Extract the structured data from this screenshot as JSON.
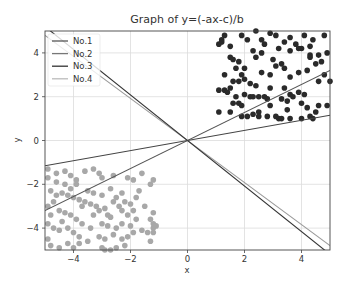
{
  "chart_data": {
    "type": "scatter",
    "title": "Graph of y=(-ax-c)/b",
    "xlabel": "x",
    "ylabel": "y",
    "xlim": [
      -5,
      5
    ],
    "ylim": [
      -5,
      5
    ],
    "xticks": [
      -4,
      -2,
      0,
      2,
      4
    ],
    "yticks": [
      -4,
      -2,
      0,
      2,
      4
    ],
    "grid": true,
    "legend_position": "upper left",
    "lines": [
      {
        "name": "No.1",
        "slope": 0.64,
        "intercept": 0,
        "color": "#555555"
      },
      {
        "name": "No.2",
        "slope": -0.96,
        "intercept": 0,
        "color": "#777777"
      },
      {
        "name": "No.3",
        "slope": -1.04,
        "intercept": 0,
        "color": "#333333"
      },
      {
        "name": "No.4",
        "slope": 0.23,
        "intercept": 0,
        "color": "#bbbbbb"
      }
    ],
    "lines_note": "No.4 drawn in legend as light gray; the shallow ascending line renders dark (#444). Colors kept per legend swatches.",
    "series": [
      {
        "name": "class-positive",
        "color": "#2a2a2a",
        "points": [
          [
            1.1,
            4.4
          ],
          [
            1.2,
            4.6
          ],
          [
            1.3,
            4.8
          ],
          [
            1.2,
            4.5
          ],
          [
            1.5,
            4.3
          ],
          [
            1.9,
            4.8
          ],
          [
            2.4,
            5.0
          ],
          [
            2.6,
            4.6
          ],
          [
            2.9,
            4.9
          ],
          [
            3.1,
            4.8
          ],
          [
            3.4,
            4.5
          ],
          [
            3.6,
            4.7
          ],
          [
            3.8,
            4.4
          ],
          [
            3.9,
            4.2
          ],
          [
            4.3,
            4.3
          ],
          [
            4.3,
            3.9
          ],
          [
            4.6,
            3.9
          ],
          [
            4.9,
            4.0
          ],
          [
            1.5,
            3.8
          ],
          [
            1.6,
            3.7
          ],
          [
            1.8,
            3.6
          ],
          [
            1.7,
            3.3
          ],
          [
            2.0,
            3.3
          ],
          [
            2.3,
            4.1
          ],
          [
            2.4,
            3.8
          ],
          [
            2.6,
            4.0
          ],
          [
            3.0,
            3.7
          ],
          [
            3.3,
            3.5
          ],
          [
            3.4,
            3.3
          ],
          [
            3.2,
            4.2
          ],
          [
            4.0,
            4.2
          ],
          [
            4.3,
            3.8
          ],
          [
            1.3,
            3.0
          ],
          [
            1.6,
            2.7
          ],
          [
            2.0,
            2.8
          ],
          [
            2.2,
            2.6
          ],
          [
            2.4,
            2.5
          ],
          [
            2.0,
            2.1
          ],
          [
            2.2,
            2.0
          ],
          [
            2.3,
            2.0
          ],
          [
            1.7,
            2.0
          ],
          [
            1.1,
            2.3
          ],
          [
            1.3,
            2.3
          ],
          [
            1.4,
            2.2
          ],
          [
            1.8,
            2.7
          ],
          [
            2.3,
            1.2
          ],
          [
            2.5,
            1.3
          ],
          [
            2.9,
            1.6
          ],
          [
            3.2,
            1.0
          ],
          [
            1.6,
            1.7
          ],
          [
            1.8,
            1.7
          ],
          [
            1.9,
            1.6
          ],
          [
            2.5,
            2.0
          ],
          [
            2.9,
            2.4
          ],
          [
            3.6,
            2.9
          ],
          [
            3.9,
            3.1
          ],
          [
            4.2,
            3.2
          ],
          [
            4.5,
            3.5
          ],
          [
            4.7,
            3.6
          ],
          [
            4.8,
            3.0
          ],
          [
            5.0,
            2.7
          ],
          [
            4.6,
            2.7
          ],
          [
            3.4,
            2.4
          ],
          [
            3.6,
            2.1
          ],
          [
            3.7,
            2.0
          ],
          [
            3.9,
            2.2
          ],
          [
            4.1,
            2.1
          ],
          [
            4.0,
            1.7
          ],
          [
            3.5,
            1.8
          ],
          [
            3.3,
            1.9
          ],
          [
            3.5,
            1.4
          ],
          [
            3.6,
            1.0
          ],
          [
            4.2,
            1.5
          ],
          [
            4.5,
            1.3
          ],
          [
            4.9,
            1.6
          ],
          [
            4.6,
            1.6
          ],
          [
            3.3,
            1.0
          ],
          [
            3.1,
            1.1
          ],
          [
            4.0,
            1.0
          ],
          [
            4.3,
            1.1
          ],
          [
            4.4,
            1.0
          ],
          [
            1.1,
            1.3
          ],
          [
            1.5,
            1.3
          ],
          [
            1.9,
            1.1
          ],
          [
            2.1,
            1.1
          ],
          [
            2.5,
            1.1
          ],
          [
            2.8,
            1.1
          ],
          [
            4.1,
            4.8
          ],
          [
            4.8,
            4.8
          ],
          [
            4.4,
            4.6
          ],
          [
            2.1,
            4.6
          ],
          [
            2.7,
            4.4
          ],
          [
            3.6,
            4.1
          ],
          [
            3.1,
            3.4
          ],
          [
            2.6,
            3.1
          ],
          [
            2.9,
            3.0
          ],
          [
            1.9,
            3.0
          ],
          [
            1.5,
            2.4
          ],
          [
            2.7,
            2.0
          ],
          [
            2.8,
            1.9
          ]
        ]
      },
      {
        "name": "class-negative",
        "color": "#a8a8a8",
        "points": [
          [
            -4.9,
            -1.3
          ],
          [
            -4.6,
            -1.5
          ],
          [
            -4.3,
            -1.4
          ],
          [
            -4.1,
            -1.6
          ],
          [
            -3.6,
            -1.4
          ],
          [
            -3.3,
            -1.3
          ],
          [
            -3.1,
            -1.5
          ],
          [
            -3.0,
            -1.7
          ],
          [
            -2.6,
            -1.6
          ],
          [
            -2.1,
            -1.7
          ],
          [
            -1.9,
            -1.8
          ],
          [
            -1.6,
            -1.5
          ],
          [
            -1.3,
            -2.0
          ],
          [
            -1.2,
            -1.8
          ],
          [
            -4.9,
            -1.7
          ],
          [
            -4.6,
            -1.9
          ],
          [
            -4.3,
            -2.0
          ],
          [
            -4.1,
            -2.2
          ],
          [
            -3.9,
            -2.0
          ],
          [
            -3.5,
            -2.3
          ],
          [
            -3.3,
            -2.4
          ],
          [
            -3.0,
            -2.5
          ],
          [
            -2.7,
            -2.2
          ],
          [
            -2.5,
            -2.6
          ],
          [
            -2.3,
            -2.4
          ],
          [
            -2.0,
            -2.9
          ],
          [
            -1.8,
            -2.6
          ],
          [
            -4.8,
            -2.3
          ],
          [
            -4.6,
            -2.5
          ],
          [
            -4.4,
            -2.4
          ],
          [
            -4.2,
            -2.5
          ],
          [
            -4.0,
            -2.6
          ],
          [
            -3.8,
            -2.7
          ],
          [
            -3.7,
            -3.0
          ],
          [
            -3.4,
            -2.9
          ],
          [
            -3.1,
            -3.2
          ],
          [
            -2.9,
            -3.1
          ],
          [
            -2.8,
            -3.4
          ],
          [
            -2.7,
            -3.5
          ],
          [
            -2.3,
            -3.2
          ],
          [
            -2.1,
            -3.4
          ],
          [
            -4.9,
            -3.0
          ],
          [
            -4.8,
            -3.4
          ],
          [
            -4.5,
            -3.2
          ],
          [
            -4.3,
            -3.3
          ],
          [
            -4.1,
            -3.4
          ],
          [
            -3.9,
            -3.6
          ],
          [
            -3.7,
            -3.8
          ],
          [
            -3.4,
            -4.0
          ],
          [
            -3.0,
            -3.8
          ],
          [
            -2.8,
            -3.9
          ],
          [
            -2.5,
            -4.0
          ],
          [
            -2.3,
            -3.8
          ],
          [
            -2.0,
            -3.9
          ],
          [
            -1.8,
            -3.6
          ],
          [
            -4.9,
            -3.8
          ],
          [
            -4.7,
            -4.0
          ],
          [
            -4.5,
            -4.1
          ],
          [
            -4.2,
            -4.0
          ],
          [
            -4.0,
            -4.2
          ],
          [
            -3.8,
            -4.4
          ],
          [
            -3.5,
            -4.6
          ],
          [
            -3.1,
            -4.4
          ],
          [
            -2.9,
            -4.5
          ],
          [
            -2.6,
            -4.3
          ],
          [
            -2.3,
            -4.5
          ],
          [
            -2.1,
            -4.4
          ],
          [
            -1.9,
            -4.2
          ],
          [
            -1.6,
            -4.1
          ],
          [
            -4.9,
            -4.5
          ],
          [
            -4.8,
            -4.8
          ],
          [
            -4.5,
            -4.9
          ],
          [
            -4.2,
            -4.7
          ],
          [
            -4.0,
            -4.9
          ],
          [
            -3.8,
            -4.7
          ],
          [
            -3.0,
            -4.9
          ],
          [
            -2.9,
            -5.0
          ],
          [
            -2.7,
            -5.0
          ],
          [
            -2.5,
            -4.9
          ],
          [
            -2.2,
            -4.8
          ],
          [
            -1.3,
            -3.6
          ],
          [
            -1.2,
            -3.8
          ],
          [
            -1.2,
            -4.2
          ],
          [
            -1.4,
            -4.2
          ],
          [
            -1.3,
            -4.6
          ],
          [
            -1.2,
            -4.0
          ],
          [
            -1.1,
            -3.9
          ],
          [
            -1.2,
            -3.3
          ],
          [
            -1.5,
            -3.0
          ],
          [
            -1.7,
            -2.3
          ],
          [
            -3.6,
            -2.8
          ],
          [
            -3.3,
            -3.4
          ],
          [
            -2.4,
            -3.0
          ],
          [
            -2.2,
            -2.8
          ],
          [
            -1.9,
            -3.2
          ],
          [
            -3.9,
            -1.8
          ],
          [
            -4.7,
            -2.8
          ],
          [
            -4.4,
            -3.7
          ],
          [
            -3.2,
            -3.0
          ],
          [
            -2.6,
            -2.8
          ]
        ]
      }
    ]
  }
}
